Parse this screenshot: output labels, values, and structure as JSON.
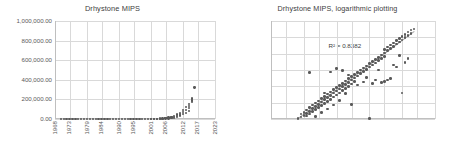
{
  "charts": [
    {
      "id": "linear",
      "title": "Drhystone MIPS",
      "y_ticks": [
        "0.00",
        "200,000.00",
        "400,000.00",
        "600,000.00",
        "800,000.00",
        "1,000,000.00"
      ],
      "x_ticks": [
        "1968",
        "1973",
        "1979",
        "1984",
        "1990",
        "1995",
        "2001",
        "2006",
        "2012",
        "2017",
        "2023"
      ],
      "r2_label": ""
    },
    {
      "id": "log",
      "title": "Drhystone MIPS, logarithmic plotting",
      "y_ticks": [
        "1.00",
        "10.00",
        "100.00",
        "1,000.00",
        "10,000.00",
        "100,000.00",
        "1,000,000.00"
      ],
      "x_ticks": [
        "1968",
        "1973",
        "1979",
        "1984",
        "1990",
        "1995",
        "2001",
        "2006",
        "2012",
        "2017",
        "2023"
      ],
      "r2_label": "R² = 0.8382"
    }
  ],
  "chart_data": [
    {
      "type": "scatter",
      "title": "Drhystone MIPS",
      "xlabel": "",
      "ylabel": "",
      "xlim": [
        1968,
        2023
      ],
      "ylim": [
        0,
        1000000
      ],
      "yscale": "linear",
      "ytick_values": [
        0,
        200000,
        400000,
        600000,
        800000,
        1000000
      ],
      "ytick_labels": [
        "0.00",
        "200,000.00",
        "400,000.00",
        "600,000.00",
        "800,000.00",
        "1,000,000.00"
      ],
      "xtick_values": [
        1968,
        1973,
        1979,
        1984,
        1990,
        1995,
        2001,
        2006,
        2012,
        2017,
        2023
      ],
      "xtick_labels": [
        "1968",
        "1973",
        "1979",
        "1984",
        "1990",
        "1995",
        "2001",
        "2006",
        "2012",
        "2017",
        "2023"
      ],
      "grid": true,
      "legend": "none",
      "marker_color": "#595959",
      "points": [
        [
          1970,
          1
        ],
        [
          1971,
          1
        ],
        [
          1972,
          1
        ],
        [
          1973,
          2
        ],
        [
          1974,
          2
        ],
        [
          1975,
          3
        ],
        [
          1976,
          4
        ],
        [
          1977,
          5
        ],
        [
          1978,
          6
        ],
        [
          1979,
          8
        ],
        [
          1980,
          10
        ],
        [
          1981,
          12
        ],
        [
          1982,
          16
        ],
        [
          1983,
          20
        ],
        [
          1984,
          26
        ],
        [
          1985,
          33
        ],
        [
          1986,
          40
        ],
        [
          1987,
          52
        ],
        [
          1988,
          66
        ],
        [
          1989,
          85
        ],
        [
          1990,
          110
        ],
        [
          1991,
          140
        ],
        [
          1992,
          180
        ],
        [
          1993,
          230
        ],
        [
          1994,
          300
        ],
        [
          1995,
          380
        ],
        [
          1996,
          500
        ],
        [
          1997,
          640
        ],
        [
          1998,
          820
        ],
        [
          1999,
          1100
        ],
        [
          2000,
          1400
        ],
        [
          2001,
          1800
        ],
        [
          2002,
          2400
        ],
        [
          2003,
          3100
        ],
        [
          2004,
          4000
        ],
        [
          2005,
          5200
        ],
        [
          2006,
          9000
        ],
        [
          2007,
          14000
        ],
        [
          2008,
          22000
        ],
        [
          2009,
          30000
        ],
        [
          2010,
          45000
        ],
        [
          2011,
          60000
        ],
        [
          2012,
          95000
        ],
        [
          2013,
          120000
        ],
        [
          2014,
          150000
        ],
        [
          2015,
          175000
        ],
        [
          2013,
          60000
        ],
        [
          2014,
          80000
        ],
        [
          2011,
          35000
        ],
        [
          2010,
          20000
        ],
        [
          2009,
          12000
        ],
        [
          2008,
          9000
        ],
        [
          2007,
          6000
        ],
        [
          2006,
          4000
        ],
        [
          2012,
          50000
        ],
        [
          2013,
          90000
        ],
        [
          2014,
          130000
        ],
        [
          2015,
          210000
        ],
        [
          2016,
          320000
        ],
        [
          2015,
          190000
        ],
        [
          2014,
          110000
        ],
        [
          2012,
          70000
        ],
        [
          2011,
          48000
        ],
        [
          2010,
          30000
        ],
        [
          2009,
          18000
        ],
        [
          2008,
          14000
        ],
        [
          2007,
          10000
        ],
        [
          2006,
          7000
        ],
        [
          2005,
          3000
        ],
        [
          2004,
          2200
        ],
        [
          2003,
          1600
        ],
        [
          2002,
          1200
        ],
        [
          2001,
          900
        ]
      ],
      "note": "Dense near-zero band 1970-2005; exponential takeoff after 2006; max ~320,000 near 2016."
    },
    {
      "type": "scatter",
      "title": "Drhystone MIPS, logarithmic plotting",
      "xlabel": "",
      "ylabel": "",
      "xlim": [
        1968,
        2023
      ],
      "ylim": [
        1,
        1000000
      ],
      "yscale": "log",
      "ytick_values": [
        1,
        10,
        100,
        1000,
        10000,
        100000,
        1000000
      ],
      "ytick_labels": [
        "1.00",
        "10.00",
        "100.00",
        "1,000.00",
        "10,000.00",
        "100,000.00",
        "1,000,000.00"
      ],
      "xtick_values": [
        1968,
        1973,
        1979,
        1984,
        1990,
        1995,
        2001,
        2006,
        2012,
        2017,
        2023
      ],
      "xtick_labels": [
        "1968",
        "1973",
        "1979",
        "1984",
        "1990",
        "1995",
        "2001",
        "2006",
        "2012",
        "2017",
        "2023"
      ],
      "grid": true,
      "legend": "none",
      "marker_color": "#595959",
      "annotations": [
        {
          "text": "R² = 0.8382",
          "x": 1992,
          "y": 30000
        }
      ],
      "trendline": {
        "type": "linear-on-log",
        "r_squared": 0.8382,
        "x0": 1977,
        "y0": 1.2,
        "x1": 2016,
        "y1": 260000
      },
      "points": [
        [
          1977,
          1.1
        ],
        [
          1978,
          1.3
        ],
        [
          1978,
          2.0
        ],
        [
          1979,
          1.6
        ],
        [
          1979,
          2.6
        ],
        [
          1980,
          2.2
        ],
        [
          1980,
          3.5
        ],
        [
          1980,
          1.5
        ],
        [
          1981,
          3.0
        ],
        [
          1981,
          5.0
        ],
        [
          1981,
          2.0
        ],
        [
          1982,
          4.5
        ],
        [
          1982,
          7.0
        ],
        [
          1982,
          2.8
        ],
        [
          1983,
          6.0
        ],
        [
          1983,
          9.5
        ],
        [
          1983,
          3.8
        ],
        [
          1984,
          8.0
        ],
        [
          1984,
          13.0
        ],
        [
          1984,
          5.0
        ],
        [
          1985,
          11.0
        ],
        [
          1985,
          18.0
        ],
        [
          1985,
          6.5
        ],
        [
          1986,
          15.0
        ],
        [
          1986,
          24.0
        ],
        [
          1986,
          9.0
        ],
        [
          1987,
          20.0
        ],
        [
          1987,
          33.0
        ],
        [
          1987,
          12.0
        ],
        [
          1988,
          28.0
        ],
        [
          1988,
          45.0
        ],
        [
          1988,
          16.0
        ],
        [
          1989,
          38.0
        ],
        [
          1989,
          62.0
        ],
        [
          1989,
          22.0
        ],
        [
          1990,
          52.0
        ],
        [
          1990,
          85.0
        ],
        [
          1990,
          30.0
        ],
        [
          1991,
          70.0
        ],
        [
          1991,
          115.0
        ],
        [
          1991,
          40.0
        ],
        [
          1992,
          95.0
        ],
        [
          1992,
          155.0
        ],
        [
          1992,
          55.0
        ],
        [
          1993,
          130.0
        ],
        [
          1993,
          210.0
        ],
        [
          1993,
          75.0
        ],
        [
          1994,
          175.0
        ],
        [
          1994,
          290.0
        ],
        [
          1994,
          100.0
        ],
        [
          1995,
          240.0
        ],
        [
          1995,
          390.0
        ],
        [
          1995,
          140.0
        ],
        [
          1996,
          320.0
        ],
        [
          1996,
          530.0
        ],
        [
          1996,
          190.0
        ],
        [
          1997,
          440.0
        ],
        [
          1997,
          720.0
        ],
        [
          1998,
          600.0
        ],
        [
          1998,
          980.0
        ],
        [
          1999,
          810.0
        ],
        [
          1999,
          1300.0
        ],
        [
          2000,
          1100.0
        ],
        [
          2000,
          1800.0
        ],
        [
          2001,
          1500.0
        ],
        [
          2001,
          2400.0
        ],
        [
          2002,
          2000.0
        ],
        [
          2002,
          3300.0
        ],
        [
          2003,
          2700.0
        ],
        [
          2003,
          4500.0
        ],
        [
          2004,
          3700.0
        ],
        [
          2004,
          6000.0
        ],
        [
          2005,
          5000.0
        ],
        [
          2005,
          8200.0
        ],
        [
          2006,
          6800.0
        ],
        [
          2006,
          11000.0
        ],
        [
          2006,
          18000.0
        ],
        [
          2007,
          15000.0
        ],
        [
          2007,
          25000.0
        ],
        [
          2008,
          20000.0
        ],
        [
          2008,
          34000.0
        ],
        [
          2009,
          28000.0
        ],
        [
          2009,
          46000.0
        ],
        [
          2010,
          38000.0
        ],
        [
          2010,
          62000.0
        ],
        [
          2011,
          52000.0
        ],
        [
          2011,
          85000.0
        ],
        [
          2012,
          70000.0
        ],
        [
          2012,
          115000.0
        ],
        [
          2013,
          95000.0
        ],
        [
          2013,
          155000.0
        ],
        [
          2014,
          130000.0
        ],
        [
          2014,
          210000.0
        ],
        [
          2015,
          175000.0
        ],
        [
          2015,
          280000.0
        ],
        [
          2016,
          330000.0
        ],
        [
          1981,
          700.0
        ],
        [
          1988,
          750.0
        ],
        [
          1990,
          1200.0
        ],
        [
          1992,
          900.0
        ],
        [
          1986,
          40.0
        ],
        [
          1994,
          500.0
        ],
        [
          1995,
          8.0
        ],
        [
          2001,
          1.1
        ],
        [
          2005,
          170.0
        ],
        [
          2006,
          200.0
        ],
        [
          2007,
          250.0
        ],
        [
          2009,
          2000.0
        ],
        [
          2010,
          1500.0
        ],
        [
          2012,
          40.0
        ],
        [
          2013,
          3000.0
        ],
        [
          2014,
          5000.0
        ],
        [
          2011,
          8000.0
        ],
        [
          2008,
          300.0
        ],
        [
          2004,
          1000.0
        ],
        [
          2003,
          250.0
        ],
        [
          2002,
          150.0
        ],
        [
          2000,
          350.0
        ],
        [
          1999,
          180.0
        ],
        [
          1997,
          120.0
        ],
        [
          1993,
          35.0
        ],
        [
          1991,
          14.0
        ],
        [
          1989,
          7.0
        ],
        [
          1987,
          4.0
        ],
        [
          1985,
          2.5
        ],
        [
          1983,
          1.4
        ]
      ],
      "note": "Log-linear growth band with R-squared 0.8382 trendline; outliers above and below band."
    }
  ]
}
